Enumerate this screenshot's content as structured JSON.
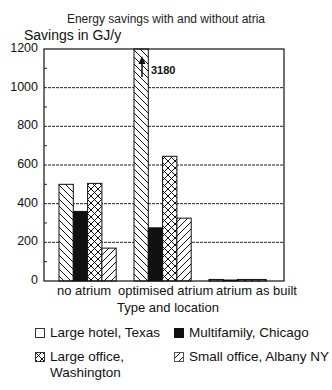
{
  "chart_data": {
    "type": "bar",
    "title": "Energy savings with and without atria",
    "ylabel": "Savings in GJ/y",
    "xlabel": "Type and location",
    "ylim": [
      0,
      1200
    ],
    "yticks": [
      0,
      200,
      400,
      600,
      800,
      1000,
      1200
    ],
    "grid": true,
    "legend_position": "bottom",
    "categories": [
      "no atrium",
      "optimised atrium",
      "atrium as built"
    ],
    "series": [
      {
        "name": "Large hotel, Texas",
        "pattern": "back-diagonal-hatch",
        "legend_glyph": "empty-square",
        "values": [
          500,
          3180,
          8
        ]
      },
      {
        "name": "Multifamily, Chicago",
        "pattern": "solid-black",
        "legend_glyph": "filled-square",
        "values": [
          360,
          275,
          5
        ]
      },
      {
        "name": "Large office, Washington",
        "pattern": "cross-hatch",
        "legend_glyph": "cross-hatch-square",
        "values": [
          505,
          645,
          8
        ]
      },
      {
        "name": "Small office, Albany NY",
        "pattern": "forward-diagonal-hatch",
        "legend_glyph": "diagonal-square",
        "values": [
          170,
          325,
          8
        ]
      }
    ],
    "annotations": [
      {
        "text": "3180",
        "target": "Large hotel, Texas / optimised atrium",
        "note": "bar truncated at axis max, arrow indicates off-scale value"
      }
    ]
  },
  "labels": {
    "title": "Energy savings with and without atria",
    "ylabel": "Savings in GJ/y",
    "xlabel": "Type and location",
    "yticks": [
      "1200",
      "1000",
      "800",
      "600",
      "400",
      "200",
      "0"
    ],
    "categories": [
      "no atrium",
      "optimised atrium",
      "atrium as built"
    ],
    "annotation": "3180",
    "legend": [
      "Large hotel, Texas",
      "Multifamily, Chicago",
      "Large office,\nWashington",
      "Small office, Albany NY"
    ]
  }
}
